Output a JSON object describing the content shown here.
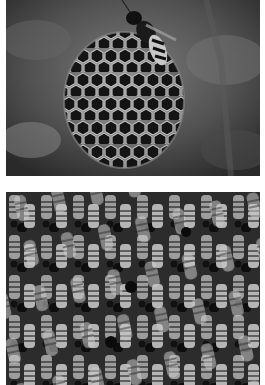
{
  "photos": [
    {
      "id": "wasp-nest",
      "subject": "Paper wasp on hexagonal paper nest comb",
      "tone": "grayscale"
    },
    {
      "id": "bee-cluster",
      "subject": "Dense cluster of honeybees on comb",
      "tone": "grayscale"
    }
  ],
  "colors": {
    "background": "#ffffff",
    "dark": "#1e1e1e",
    "mid": "#6a6a6a",
    "light": "#d8d8d8"
  }
}
